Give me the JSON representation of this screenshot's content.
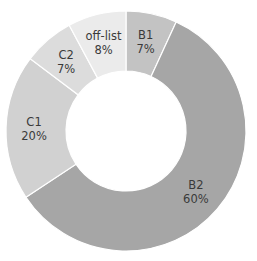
{
  "chart_data": {
    "type": "pie",
    "variant": "donut",
    "title": "",
    "categories": [
      "B1",
      "B2",
      "C1",
      "C2",
      "off-list"
    ],
    "values": [
      7,
      60,
      20,
      7,
      8
    ],
    "value_labels": [
      "7%",
      "60%",
      "20%",
      "7%",
      "8%"
    ],
    "colors": [
      "#c3c3c3",
      "#a6a6a6",
      "#d1d1d1",
      "#dcdcdc",
      "#ebebeb"
    ],
    "start_angle_deg": 0,
    "direction": "clockwise",
    "legend": "none",
    "labels_inside": true
  },
  "geometry": {
    "cx": 126,
    "cy": 131,
    "outer_r": 120,
    "inner_r": 60,
    "label_r": 92
  },
  "slices": [
    {
      "name": "B1",
      "pct": "7%"
    },
    {
      "name": "B2",
      "pct": "60%"
    },
    {
      "name": "C1",
      "pct": "20%"
    },
    {
      "name": "C2",
      "pct": "7%"
    },
    {
      "name": "off-list",
      "pct": "8%"
    }
  ]
}
